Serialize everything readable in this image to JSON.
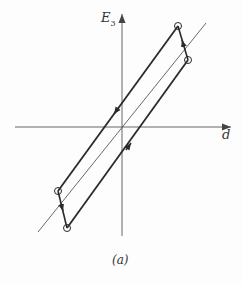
{
  "figure": {
    "caption": "(a)",
    "axes": {
      "y_label_main": "E",
      "y_label_sub": "3",
      "x_label": "d"
    },
    "colors": {
      "axis": "#666666",
      "loop": "#2a2a2a",
      "reference_line": "#444444",
      "background": "#fdfdfd"
    },
    "elements": {
      "reference_line": "thin diagonal line through origin",
      "loop": "parallelogram hysteresis loop with direction arrows",
      "markers": [
        "circle-top",
        "circle-right",
        "circle-bottom-left",
        "circle-bottom"
      ]
    }
  }
}
